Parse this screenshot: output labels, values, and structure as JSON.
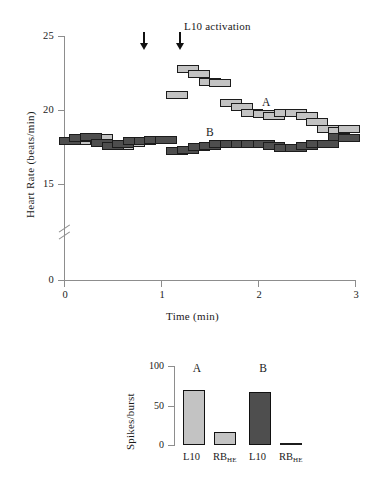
{
  "figure": {
    "main_plot": {
      "y_axis_title": "Heart Rate  (beats/min)",
      "x_axis_title": "Time  (min)",
      "y_ticks": [
        "0",
        "15",
        "20",
        "25"
      ],
      "x_ticks": [
        "0",
        "1",
        "2",
        "3"
      ],
      "annotation": "L10 activation",
      "series_label_a": "A",
      "series_label_b": "B"
    },
    "bar_chart": {
      "y_axis_title": "Spikes/burst",
      "y_ticks": [
        "0",
        "50",
        "100"
      ],
      "group_a_label": "A",
      "group_b_label": "B",
      "x_label_l10": "L10",
      "x_label_rb": "RB",
      "x_label_rb_sub": "HE"
    }
  },
  "chart_data": [
    {
      "type": "scatter",
      "name": "heart-rate-time-series",
      "title": "",
      "xlabel": "Time  (min)",
      "ylabel": "Heart Rate  (beats/min)",
      "xlim": [
        0,
        3
      ],
      "ylim": [
        14.2,
        25
      ],
      "y_break": true,
      "y_break_between": [
        0,
        14.2
      ],
      "y_ticks": [
        0,
        15,
        20,
        25
      ],
      "x_ticks": [
        0,
        1,
        2,
        3
      ],
      "grid": false,
      "legend": "inline-labels",
      "annotations": [
        {
          "text": "L10 activation",
          "x": 1.25,
          "y": 24.6
        },
        {
          "text": "A",
          "x": 2.22,
          "y": 20.6
        },
        {
          "text": "B",
          "x": 1.75,
          "y": 18.5
        },
        {
          "text": "arrow",
          "x": 0.82,
          "y": 24.0
        },
        {
          "text": "arrow",
          "x": 1.0,
          "y": 24.0
        }
      ],
      "marker_style": "filled rectangle with black outline",
      "series": [
        {
          "name": "A",
          "color": "#c3c3c3",
          "x": [
            0.06,
            0.17,
            0.28,
            0.39,
            0.5,
            0.61,
            0.72,
            0.83,
            0.94,
            1.05,
            1.17,
            1.28,
            1.39,
            1.5,
            1.61,
            1.72,
            1.83,
            1.94,
            2.06,
            2.17,
            2.28,
            2.39,
            2.5,
            2.61,
            2.72,
            2.83,
            2.94
          ],
          "values": [
            17.9,
            17.9,
            18.2,
            18.1,
            17.7,
            17.6,
            17.8,
            17.9,
            18.0,
            18.0,
            21.0,
            22.8,
            22.4,
            21.9,
            21.8,
            20.5,
            20.2,
            19.8,
            19.7,
            19.6,
            19.8,
            19.8,
            19.6,
            19.2,
            18.7,
            18.6,
            18.7
          ]
        },
        {
          "name": "B",
          "color": "#4e4e4e",
          "x": [
            0.06,
            0.17,
            0.28,
            0.39,
            0.5,
            0.61,
            0.72,
            0.83,
            0.94,
            1.05,
            1.17,
            1.28,
            1.39,
            1.5,
            1.61,
            1.72,
            1.83,
            1.94,
            2.06,
            2.17,
            2.28,
            2.39,
            2.5,
            2.61,
            2.72,
            2.83,
            2.94
          ],
          "values": [
            17.9,
            18.1,
            18.2,
            17.8,
            17.6,
            17.7,
            17.9,
            17.9,
            18.0,
            18.0,
            17.2,
            17.3,
            17.5,
            17.6,
            17.7,
            17.7,
            17.7,
            17.7,
            17.7,
            17.6,
            17.4,
            17.4,
            17.6,
            17.7,
            17.7,
            18.2,
            18.1
          ]
        }
      ]
    },
    {
      "type": "bar",
      "name": "spikes-per-burst",
      "title": "",
      "xlabel": "",
      "ylabel": "Spikes/burst",
      "ylim": [
        0,
        100
      ],
      "y_ticks": [
        0,
        50,
        100
      ],
      "grid": false,
      "categories": [
        "A / L10",
        "A / RB_HE",
        "B / L10",
        "B / RB_HE"
      ],
      "values": [
        70,
        17,
        67,
        1
      ],
      "colors": [
        "#c3c3c3",
        "#c3c3c3",
        "#4e4e4e",
        "#4e4e4e"
      ]
    }
  ]
}
